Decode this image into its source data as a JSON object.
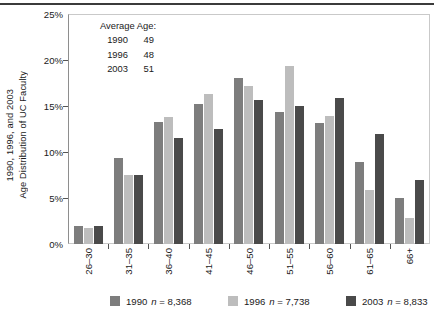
{
  "chart_data": {
    "type": "bar",
    "title": "",
    "xlabel": "",
    "ylabel": "Age Distribution of UC Faculty 1990, 1996, and 2003",
    "ylabel_lines": [
      "Age Distribution of UC Faculty",
      "1990, 1996, and 2003"
    ],
    "categories": [
      "26–30",
      "31–35",
      "36–40",
      "41–45",
      "46–50",
      "51–55",
      "56–60",
      "61–65",
      "66+"
    ],
    "series": [
      {
        "name": "1990",
        "n": "8,368",
        "color": "#7d7d7d",
        "values": [
          2.0,
          9.3,
          13.3,
          15.2,
          18.0,
          14.3,
          13.2,
          8.9,
          5.0
        ]
      },
      {
        "name": "1996",
        "n": "7,738",
        "color": "#bdbdbd",
        "values": [
          1.7,
          7.5,
          13.8,
          16.3,
          17.2,
          19.3,
          13.9,
          5.9,
          2.8
        ]
      },
      {
        "name": "2003",
        "n": "8,833",
        "color": "#4a4a4a",
        "values": [
          2.0,
          7.5,
          11.5,
          12.5,
          15.7,
          15.0,
          15.9,
          12.0,
          7.0
        ]
      }
    ],
    "ylim": [
      0,
      25
    ],
    "yticks": [
      0,
      5,
      10,
      15,
      20,
      25
    ],
    "ytick_labels": [
      "0%",
      "5%",
      "10%",
      "15%",
      "20%",
      "25%"
    ],
    "grid": false,
    "legend_position": "bottom",
    "annotations": {
      "title": "Average Age:",
      "rows": [
        {
          "year": "1990",
          "value": "49"
        },
        {
          "year": "1996",
          "value": "48"
        },
        {
          "year": "2003",
          "value": "51"
        }
      ]
    }
  },
  "legend": {
    "items": [
      {
        "label": "1990",
        "n_prefix": "n",
        "equals": "=",
        "count": "8,368"
      },
      {
        "label": "1996",
        "n_prefix": "n",
        "equals": "=",
        "count": "7,738"
      },
      {
        "label": "2003",
        "n_prefix": "n",
        "equals": "=",
        "count": "8,833"
      }
    ]
  }
}
